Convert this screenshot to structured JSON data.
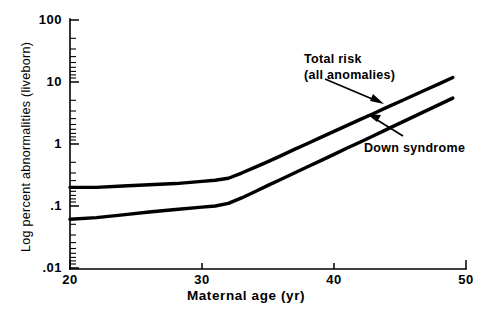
{
  "chart_data": {
    "type": "line",
    "title": "",
    "xlabel": "Maternal age (yr)",
    "ylabel": "Log percent abnormalities (liveborn)",
    "xlim": [
      20,
      50
    ],
    "ylim": [
      0.01,
      100
    ],
    "yscale": "log",
    "xscale": "linear",
    "grid": false,
    "legend_position": "none",
    "xticks": [
      "20",
      "30",
      "40",
      "50"
    ],
    "xtick_values": [
      20,
      30,
      40,
      50
    ],
    "yticks": [
      "100",
      "10",
      "1",
      ".1",
      ".01"
    ],
    "ytick_values": [
      100,
      10,
      1,
      0.1,
      0.01
    ],
    "series": [
      {
        "name": "Total risk (all anomalies)",
        "x": [
          20,
          22,
          24,
          26,
          28,
          30,
          31,
          32,
          33,
          34,
          35,
          36,
          37,
          38,
          39,
          40,
          41,
          42,
          43,
          44,
          45,
          46,
          47,
          48,
          49
        ],
        "values": [
          0.2,
          0.2,
          0.21,
          0.22,
          0.23,
          0.25,
          0.26,
          0.28,
          0.34,
          0.42,
          0.52,
          0.65,
          0.82,
          1.02,
          1.28,
          1.6,
          2.0,
          2.5,
          3.1,
          3.9,
          4.85,
          6.05,
          7.55,
          9.4,
          11.8
        ]
      },
      {
        "name": "Down syndrome",
        "x": [
          20,
          22,
          24,
          26,
          28,
          30,
          31,
          32,
          33,
          34,
          35,
          36,
          37,
          38,
          39,
          40,
          41,
          42,
          43,
          44,
          45,
          46,
          47,
          48,
          49
        ],
        "values": [
          0.061,
          0.065,
          0.072,
          0.08,
          0.088,
          0.096,
          0.1,
          0.11,
          0.135,
          0.17,
          0.215,
          0.27,
          0.34,
          0.43,
          0.54,
          0.68,
          0.86,
          1.08,
          1.36,
          1.72,
          2.17,
          2.74,
          3.45,
          4.36,
          5.5
        ]
      }
    ],
    "annotations": [
      {
        "id": "total-risk",
        "line1": "Total risk",
        "line2": "(all anomalies)",
        "points_to_series": "Total risk (all anomalies)"
      },
      {
        "id": "down-syndrome",
        "line1": "Down syndrome",
        "line2": "",
        "points_to_series": "Down syndrome"
      }
    ]
  },
  "axes": {
    "x_title": "Maternal age (yr)",
    "y_title": "Log percent abnormalities (liveborn)",
    "x_tick_labels": [
      "20",
      "30",
      "40",
      "50"
    ],
    "y_tick_labels": [
      "100",
      "10",
      "1",
      ".1",
      ".01"
    ]
  },
  "annotations": {
    "total_risk_line1": "Total risk",
    "total_risk_line2": "(all anomalies)",
    "down_syndrome": "Down syndrome"
  },
  "colors": {
    "background": "#ffffff",
    "ink": "#000000",
    "curve": "#000000"
  }
}
